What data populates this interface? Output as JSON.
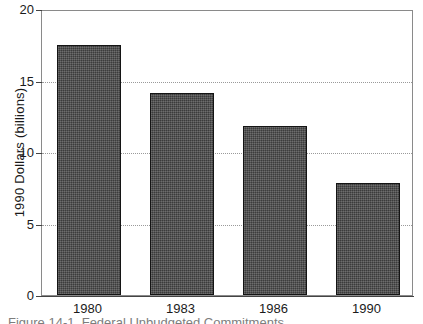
{
  "chart_data": {
    "type": "bar",
    "title": "",
    "subtitle": "",
    "xlabel": "",
    "ylabel": "1990 Dollars (billions)",
    "categories": [
      "1980",
      "1983",
      "1986",
      "1990"
    ],
    "values": [
      17.5,
      14.1,
      11.8,
      7.8
    ],
    "series": [
      {
        "name": "1990 Dollars (billions)",
        "values": [
          17.5,
          14.1,
          11.8,
          7.8
        ]
      }
    ],
    "ylim": [
      0,
      20
    ],
    "ytick_labels": [
      "0",
      "5",
      "10",
      "15",
      "20"
    ],
    "ytick_values": [
      0,
      5,
      10,
      15,
      20
    ],
    "grid": "horizontal-dotted",
    "gridline_values": [
      5,
      10,
      15
    ],
    "legend": "none",
    "bar_color": "#4a4a4a",
    "bar_edge_color": "#141414",
    "axis_color": "#444444",
    "grid_color": "#9a9a9a",
    "plot_border_color": "#8a8a8a",
    "background_color": "#ffffff"
  },
  "caption": {
    "text": "Figure 14-1. Federal Unbudgeted Commitments"
  }
}
